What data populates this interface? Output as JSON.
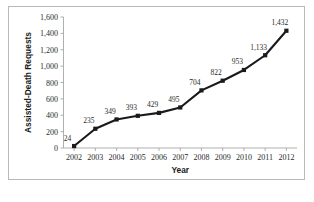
{
  "chart_data": {
    "type": "line",
    "title": "",
    "xlabel": "Year",
    "ylabel": "Assisted-Death Requests",
    "categories": [
      "2002",
      "2003",
      "2004",
      "2005",
      "2006",
      "2007",
      "2008",
      "2009",
      "2010",
      "2011",
      "2012"
    ],
    "values": [
      24,
      235,
      349,
      393,
      429,
      495,
      704,
      822,
      953,
      1133,
      1432
    ],
    "point_labels": [
      "24",
      "235",
      "349",
      "393",
      "429",
      "495",
      "704",
      "822",
      "953",
      "1,133",
      "1,432"
    ],
    "ylim": [
      0,
      1600
    ],
    "ytick_values": [
      0,
      200,
      400,
      600,
      800,
      1000,
      1200,
      1400,
      1600
    ],
    "ytick_labels": [
      "0",
      "200",
      "400",
      "600",
      "800",
      "1,000",
      "1,200",
      "1,400",
      "1,600"
    ],
    "grid": false,
    "legend": "none",
    "marker": "square",
    "line_color": "#1a1a1a",
    "marker_color": "#1a1a1a",
    "axis_color": "#a6a6a6",
    "frame_color": "#b9b9b9",
    "background": "#ffffff"
  }
}
